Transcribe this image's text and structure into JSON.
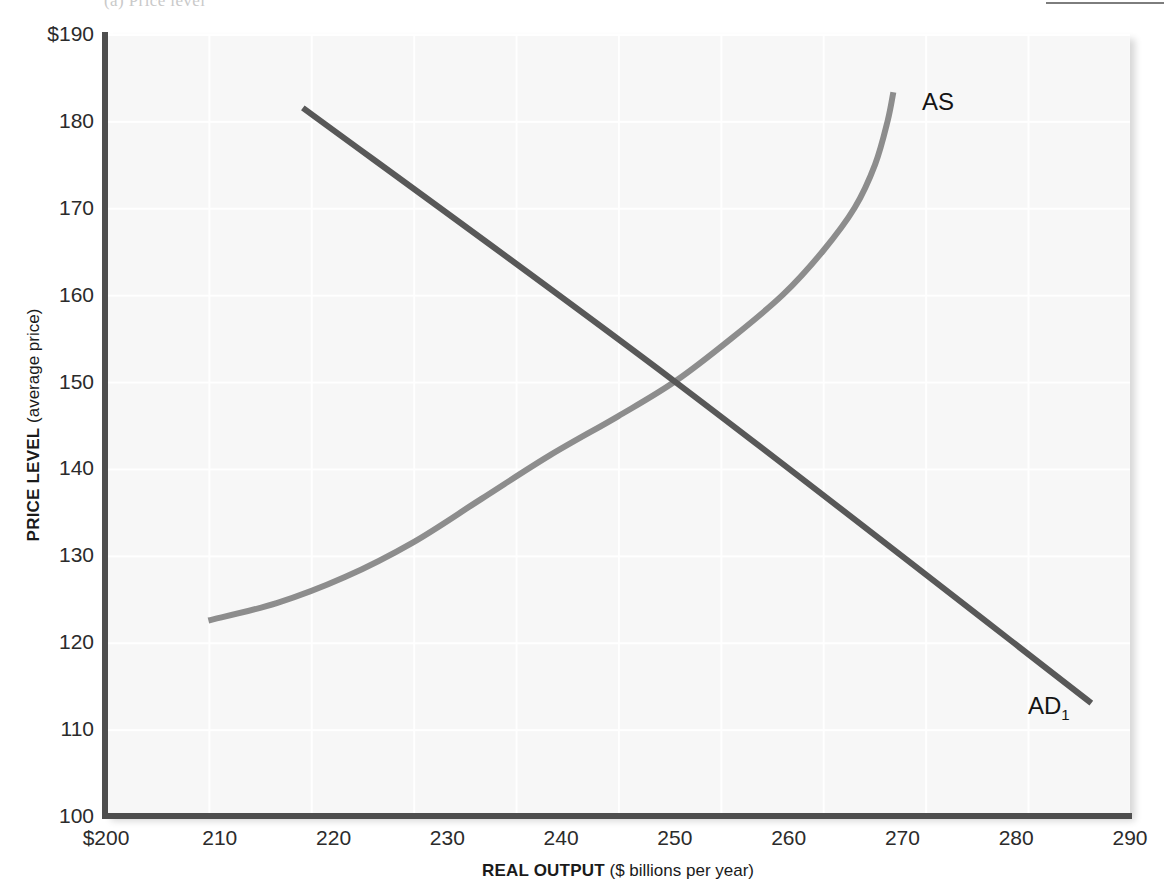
{
  "page": {
    "header_caption": "(a)  Price level",
    "header_rule": "rule"
  },
  "chart_data": {
    "type": "line",
    "title": "",
    "xlabel_bold": "REAL OUTPUT",
    "xlabel_rest": " ($ billions per year)",
    "ylabel_bold": "PRICE LEVEL",
    "ylabel_rest": " (average price)",
    "xlim": [
      200,
      290
    ],
    "ylim": [
      100,
      190
    ],
    "x_ticks": [
      "$200",
      "210",
      "220",
      "230",
      "240",
      "250",
      "260",
      "270",
      "280",
      "290"
    ],
    "x_tick_values": [
      200,
      210,
      220,
      230,
      240,
      250,
      260,
      270,
      280,
      290
    ],
    "y_ticks": [
      "$190",
      "180",
      "170",
      "160",
      "150",
      "140",
      "130",
      "120",
      "110",
      "100"
    ],
    "y_tick_values": [
      190,
      180,
      170,
      160,
      150,
      140,
      130,
      120,
      110,
      100
    ],
    "grid": true,
    "legend_position": "inline-curve-labels",
    "equilibrium": {
      "x": 250,
      "y": 150
    },
    "series": [
      {
        "name": "AS",
        "label": "AS",
        "color": "#8d8d8d",
        "description": "aggregate supply, upward sloping and steepening",
        "points": [
          [
            209.0,
            122.5
          ],
          [
            215.0,
            124.5
          ],
          [
            221.0,
            127.5
          ],
          [
            227.0,
            131.5
          ],
          [
            233.0,
            136.5
          ],
          [
            239.0,
            141.5
          ],
          [
            245.0,
            146.0
          ],
          [
            250.0,
            150.0
          ],
          [
            255.0,
            155.0
          ],
          [
            259.5,
            160.0
          ],
          [
            263.0,
            165.0
          ],
          [
            265.8,
            170.0
          ],
          [
            267.6,
            175.0
          ],
          [
            268.7,
            180.0
          ],
          [
            269.2,
            183.3
          ]
        ]
      },
      {
        "name": "AD1",
        "label": "AD",
        "label_sub": "1",
        "color": "#585858",
        "description": "aggregate demand, downward sloping straight line",
        "points": [
          [
            217.3,
            181.5
          ],
          [
            250.0,
            150.0
          ],
          [
            286.6,
            113.0
          ]
        ]
      }
    ]
  },
  "curve_labels": {
    "as": "AS",
    "ad_main": "AD",
    "ad_sub": "1"
  }
}
